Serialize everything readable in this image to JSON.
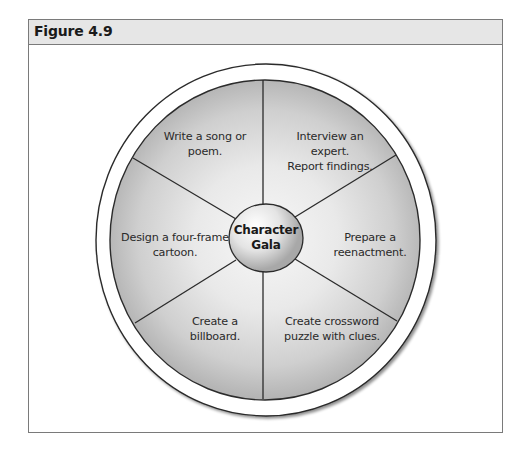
{
  "figure": {
    "title": "Figure 4.9"
  },
  "diagram": {
    "type": "wheel",
    "center": {
      "line1": "Character",
      "line2": "Gala"
    },
    "segments": [
      {
        "position": "top-left",
        "lines": [
          "Write a song or",
          "poem."
        ]
      },
      {
        "position": "top-right",
        "lines": [
          "Interview an",
          "expert.",
          "Report findings."
        ]
      },
      {
        "position": "right",
        "lines": [
          "Prepare a",
          "reenactment."
        ]
      },
      {
        "position": "bottom-right",
        "lines": [
          "Create crossword",
          "puzzle with clues."
        ]
      },
      {
        "position": "bottom-left",
        "lines": [
          "Create a",
          "billboard."
        ]
      },
      {
        "position": "left",
        "lines": [
          "Design a four-frame",
          "cartoon."
        ]
      }
    ],
    "colors": {
      "fill_light": "#f4f4f4",
      "fill_dark": "#b9b9b9",
      "stroke": "#2b2b2b",
      "header_bg": "#e6e6e6"
    }
  }
}
